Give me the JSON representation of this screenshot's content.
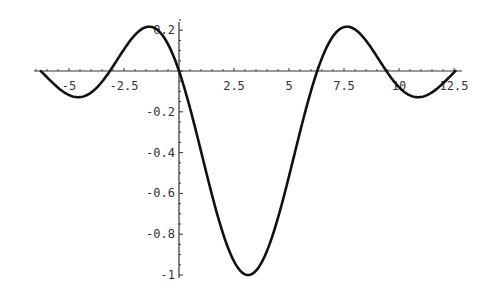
{
  "chart_data": {
    "type": "line",
    "title": "",
    "xlabel": "",
    "ylabel": "",
    "function": "sin(x)/(x - pi)",
    "xlim": [
      -6.28,
      12.57
    ],
    "ylim": [
      -1.0,
      0.22
    ],
    "grid": false,
    "legend": null,
    "x_ticks": [
      {
        "value": -5,
        "label": "-5"
      },
      {
        "value": -2.5,
        "label": "-2.5"
      },
      {
        "value": 2.5,
        "label": "2.5"
      },
      {
        "value": 5,
        "label": "5"
      },
      {
        "value": 7.5,
        "label": "7.5"
      },
      {
        "value": 10,
        "label": "10"
      },
      {
        "value": 12.5,
        "label": "12.5"
      }
    ],
    "y_ticks": [
      {
        "value": 0.2,
        "label": "0.2"
      },
      {
        "value": -0.2,
        "label": "-0.2"
      },
      {
        "value": -0.4,
        "label": "-0.4"
      },
      {
        "value": -0.6,
        "label": "-0.6"
      },
      {
        "value": -0.8,
        "label": "-0.8"
      },
      {
        "value": -1,
        "label": "-1"
      }
    ],
    "series": [
      {
        "name": "f(x)",
        "x": [
          -6.28,
          -5.5,
          -4.5,
          -3.14,
          -2.0,
          -1.1,
          0,
          1.0,
          2.0,
          3.14,
          4.0,
          5.0,
          6.28,
          7.5,
          8.5,
          9.42,
          10.5,
          11.0,
          12.57
        ],
        "y": [
          0.0,
          -0.081,
          -0.128,
          0.0,
          0.177,
          0.21,
          0.0,
          -0.39,
          -0.797,
          -1.0,
          -0.881,
          -0.516,
          0.0,
          0.215,
          0.149,
          0.0,
          -0.119,
          -0.126,
          0.0
        ]
      }
    ],
    "key_points": {
      "minimum": {
        "x": 3.14,
        "y": -1.0
      },
      "local_max_left": {
        "x": -1.1,
        "y": 0.21
      },
      "local_max_right": {
        "x": 7.5,
        "y": 0.215
      },
      "zeros": [
        -6.28,
        -3.14,
        0,
        6.28,
        9.42,
        12.57
      ]
    },
    "line_color": "#111111",
    "axis_color": "#333333"
  }
}
